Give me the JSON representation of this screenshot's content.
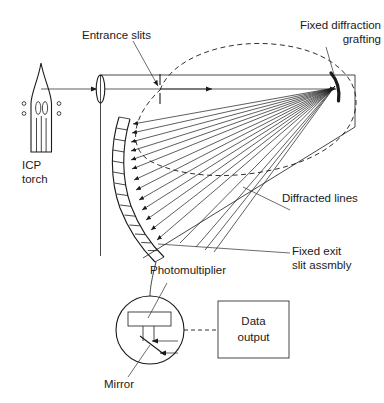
{
  "figure": {
    "domain_kind": "diagram",
    "background_color": "#ffffff",
    "ink_color": "#1a1a1a"
  },
  "labels": {
    "entrance_slits": "Entrance slits",
    "fixed_diffraction_grating_line1": "Fixed diffraction",
    "fixed_diffraction_grating_line2": "grafting",
    "diffracted_lines": "Diffracted lines",
    "fixed_exit_slit_line1": "Fixed exit",
    "fixed_exit_slit_line2": "slit assmbly",
    "photomultiplier": "Photomultiplier",
    "mirror": "Mirror",
    "data_output_line1": "Data",
    "data_output_line2": "output",
    "icp_torch_line1": "ICP",
    "icp_torch_line2": "torch"
  },
  "components": {
    "icp_torch": {
      "name": "ICP torch",
      "coil_dots_left": 2,
      "coil_dots_right": 2,
      "inner_tubes": 3
    },
    "lens": {
      "name": "collimating lens"
    },
    "entrance_slit": {
      "name": "entrance slit aperture"
    },
    "grating": {
      "name": "fixed concave diffraction grating"
    },
    "exit_slit_assembly": {
      "name": "fixed exit slit assembly",
      "segment_count": 15
    },
    "rowland_circle": {
      "name": "Rowland circle",
      "style": "dashed"
    },
    "photomultiplier": {
      "name": "photomultiplier tube",
      "mirror": "Mirror"
    },
    "data_output": {
      "name": "Data output box"
    },
    "diffracted_rays": {
      "count": 13
    }
  }
}
